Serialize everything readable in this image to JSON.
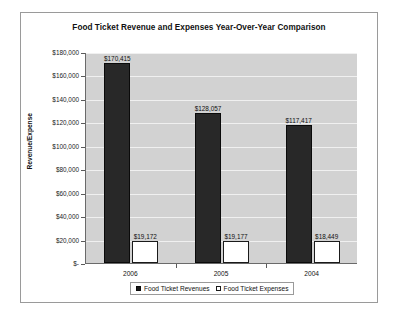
{
  "chart_data": {
    "type": "bar",
    "title": "Food Ticket Revenue and Expenses Year-Over-Year Comparison",
    "xlabel": "",
    "ylabel": "Revenue/Expense",
    "categories": [
      "2006",
      "2005",
      "2004"
    ],
    "series": [
      {
        "name": "Food Ticket Revenues",
        "values": [
          170415,
          128057,
          117417
        ],
        "labels": [
          "$170,415",
          "$128,057",
          "$117,417"
        ],
        "color": "#282828",
        "swatch": "filled"
      },
      {
        "name": "Food Ticket Expenses",
        "values": [
          19172,
          19177,
          18449
        ],
        "labels": [
          "$19,172",
          "$19,177",
          "$18,449"
        ],
        "color": "#ffffff",
        "swatch": "open"
      }
    ],
    "ylim": [
      0,
      180000
    ],
    "ytick_values": [
      180000,
      160000,
      140000,
      120000,
      100000,
      80000,
      60000,
      40000,
      20000,
      0
    ],
    "ytick_labels": [
      "$180,000",
      "$160,000",
      "$140,000",
      "$120,000",
      "$100,000",
      "$80,000",
      "$60,000",
      "$40,000",
      "$20,000",
      "$-"
    ],
    "grid": true,
    "legend_position": "bottom",
    "plot_background": "#d2d2d2",
    "frame_background": "#ffffff"
  }
}
